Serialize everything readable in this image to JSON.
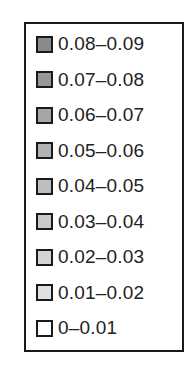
{
  "chart_data": {
    "type": "legend",
    "title": "",
    "legend_position": "standalone",
    "entries": [
      {
        "label": "0.08–0.09",
        "color": "#8a8a8a"
      },
      {
        "label": "0.07–0.08",
        "color": "#979797"
      },
      {
        "label": "0.06–0.07",
        "color": "#a6a6a6"
      },
      {
        "label": "0.05–0.06",
        "color": "#b2b2b2"
      },
      {
        "label": "0.04–0.05",
        "color": "#bebebe"
      },
      {
        "label": "0.03–0.04",
        "color": "#c9c9c9"
      },
      {
        "label": "0.02–0.03",
        "color": "#d4d4d4"
      },
      {
        "label": "0.01–0.02",
        "color": "#e0e0e0"
      },
      {
        "label": "0–0.01",
        "color": "#ffffff"
      }
    ]
  }
}
